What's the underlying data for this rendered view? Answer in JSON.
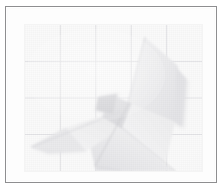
{
  "image": {
    "kind": "framed-photograph",
    "subject": "white origami paper sculpture resembling a butterfly or bird resting on gridded graph paper",
    "caption": "",
    "overall_tone": "high-key, very pale, low contrast",
    "canvas": {
      "width": 223,
      "height": 192
    }
  },
  "frame": {
    "border_color": "#8e8e90",
    "border_width_px": 1,
    "mat_color": "#fdfdfd",
    "outer_background": "#ffffff",
    "bounds": {
      "x": 5,
      "y": 6,
      "width": 212,
      "height": 177
    }
  },
  "photo": {
    "bounds": {
      "x": 17,
      "y": 16,
      "width": 177,
      "height": 146
    },
    "paper_color": "#fafafa",
    "grid": {
      "line_color": "#d8d8dc",
      "columns": 5,
      "rows": 4,
      "vertical_fractions": [
        0.2,
        0.4,
        0.6,
        0.8
      ],
      "horizontal_fractions": [
        0.25,
        0.5,
        0.75
      ],
      "visible": true
    },
    "shapes": [
      {
        "name": "upper-right-wing",
        "fill": "#eeeeef",
        "points": "120,12 152,40 150,96 104,78"
      },
      {
        "name": "upper-right-wing-shadow",
        "fill": "#e4e4e6",
        "points": "150,40 160,52 157,100 150,96"
      },
      {
        "name": "right-wing-fold",
        "fill": "#f2f2f3",
        "points": "104,78 150,96 141,140 96,100"
      },
      {
        "name": "lower-right-wing",
        "fill": "#e9e9eb",
        "points": "96,100 141,140 152,146 72,146 66,120"
      },
      {
        "name": "left-wing",
        "fill": "#f0f0f1",
        "points": "96,84 40,104 6,122 60,126 92,104"
      },
      {
        "name": "left-wing-shadow",
        "fill": "#e6e6e8",
        "points": "40,104 6,122 22,128 60,126"
      },
      {
        "name": "body-crease",
        "fill": "#dcdcde",
        "points": "86,70 106,78 96,102 78,92"
      },
      {
        "name": "head-notch",
        "fill": "#d2d2d5",
        "points": "74,72 92,70 88,88 72,84"
      }
    ],
    "creases": [
      {
        "name": "central-spine",
        "from": [
          104,
          78
        ],
        "to": [
          70,
          140
        ],
        "color": "#c9c9cd"
      },
      {
        "name": "right-wing-vein",
        "from": [
          120,
          12
        ],
        "to": [
          104,
          78
        ],
        "color": "#d3d3d7"
      },
      {
        "name": "left-wing-vein",
        "from": [
          96,
          86
        ],
        "to": [
          8,
          122
        ],
        "color": "#d6d6da"
      },
      {
        "name": "lower-fold",
        "from": [
          96,
          100
        ],
        "to": [
          150,
          146
        ],
        "color": "#d0d0d4"
      },
      {
        "name": "tail-edge",
        "from": [
          70,
          140
        ],
        "to": [
          96,
          146
        ],
        "color": "#d9d9dd"
      }
    ]
  }
}
